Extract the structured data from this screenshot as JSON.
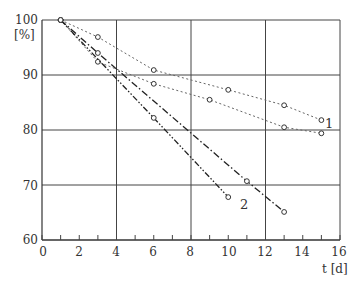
{
  "chart_data": {
    "type": "line",
    "title": "",
    "xlabel": "t [d]",
    "ylabel": "[%]",
    "xlim": [
      0,
      16
    ],
    "ylim": [
      60,
      100
    ],
    "xticks": [
      0,
      2,
      4,
      6,
      8,
      10,
      12,
      14,
      16
    ],
    "yticks": [
      60,
      70,
      80,
      90,
      100
    ],
    "grid": {
      "x": [
        4,
        8,
        12,
        16
      ],
      "y": [
        70,
        80,
        90,
        100
      ]
    },
    "legend": "curve labels inline: 1 (dotted curves), 2 (dash-dot curves)",
    "series": [
      {
        "name": "1a",
        "group": "1",
        "style": "dotted",
        "x": [
          1,
          3,
          6,
          10,
          13,
          15
        ],
        "y": [
          100,
          96.9,
          90.9,
          87.3,
          84.5,
          81.8
        ]
      },
      {
        "name": "1b",
        "group": "1",
        "style": "dotted",
        "x": [
          1,
          3,
          6,
          9,
          13,
          15
        ],
        "y": [
          100,
          92.4,
          88.4,
          85.5,
          80.5,
          79.4
        ]
      },
      {
        "name": "2a",
        "group": "2",
        "style": "dashdot",
        "x": [
          1,
          3,
          11,
          13
        ],
        "y": [
          100,
          94.0,
          70.7,
          65.1
        ]
      },
      {
        "name": "2b",
        "group": "2",
        "style": "dashdotdot",
        "x": [
          1,
          6,
          10
        ],
        "y": [
          100,
          82.2,
          67.8
        ]
      }
    ],
    "annotations": [
      {
        "text": "1",
        "x": 15.4,
        "y": 80.6
      },
      {
        "text": "2",
        "x": 10.8,
        "y": 66.5
      }
    ]
  },
  "labels": {
    "y_unit": "[%]",
    "x_unit": "t [d]",
    "curve1": "1",
    "curve2": "2",
    "yticks": [
      "100",
      "90",
      "80",
      "70",
      "60"
    ],
    "xticks": [
      "0",
      "2",
      "4",
      "6",
      "8",
      "10",
      "12",
      "14",
      "16"
    ]
  }
}
